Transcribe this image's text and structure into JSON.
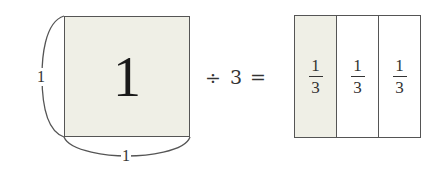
{
  "figure": {
    "unit_square": {
      "value": "1",
      "side_label_left": "1",
      "side_label_bottom": "1",
      "fill_color": "#efefe6"
    },
    "operator": "÷",
    "divisor": "3",
    "equals": "=",
    "parts": [
      {
        "numerator": "1",
        "denominator": "3",
        "shaded": true
      },
      {
        "numerator": "1",
        "denominator": "3",
        "shaded": false
      },
      {
        "numerator": "1",
        "denominator": "3",
        "shaded": false
      }
    ]
  }
}
